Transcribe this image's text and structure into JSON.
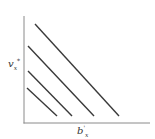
{
  "figure": {
    "type": "diagram",
    "x_axis": {
      "base": "b",
      "prime": "'",
      "subscript": "x"
    },
    "y_axis": {
      "base": "v",
      "subscript": "x",
      "superscript": "*"
    },
    "colors": {
      "line": "#3a3a3a",
      "axis": "#888888",
      "background": "#ffffff"
    }
  },
  "chart_data": {
    "type": "line",
    "title": "",
    "xlabel": "b'_x",
    "ylabel": "v_x*",
    "grid": false,
    "legend": null,
    "series": [
      {
        "name": "line-1",
        "points": [
          [
            35,
            24
          ],
          [
            119,
            116
          ]
        ]
      },
      {
        "name": "line-2",
        "points": [
          [
            28,
            46
          ],
          [
            94,
            116
          ]
        ]
      },
      {
        "name": "line-3",
        "points": [
          [
            28,
            71
          ],
          [
            72,
            116
          ]
        ]
      },
      {
        "name": "line-4",
        "points": [
          [
            27,
            88
          ],
          [
            57,
            116
          ]
        ]
      }
    ],
    "axes": {
      "origin": [
        24,
        123
      ],
      "x_end": [
        150,
        123
      ],
      "y_end": [
        24,
        16
      ]
    }
  }
}
